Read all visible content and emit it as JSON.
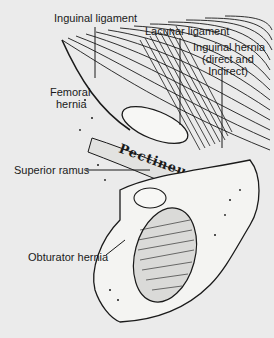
{
  "figure": {
    "type": "anatomical line drawing",
    "muscle_label": "Pectineus"
  },
  "labels": {
    "inguinal_ligament": "Inguinal ligament",
    "lacunar_ligament": "Lacunar ligament",
    "inguinal_hernia_line1": "Inguinal hernia",
    "inguinal_hernia_line2": "(direct and",
    "inguinal_hernia_line3": "Indirect)",
    "femoral_hernia_line1": "Femoral",
    "femoral_hernia_line2": "hernia",
    "superior_ramus": "Superior ramus",
    "obturator_hernia": "Obturator hernia"
  },
  "colors": {
    "background": "#ebebeb",
    "ink": "#1a1a1a",
    "bone": "#f4f4f2"
  }
}
